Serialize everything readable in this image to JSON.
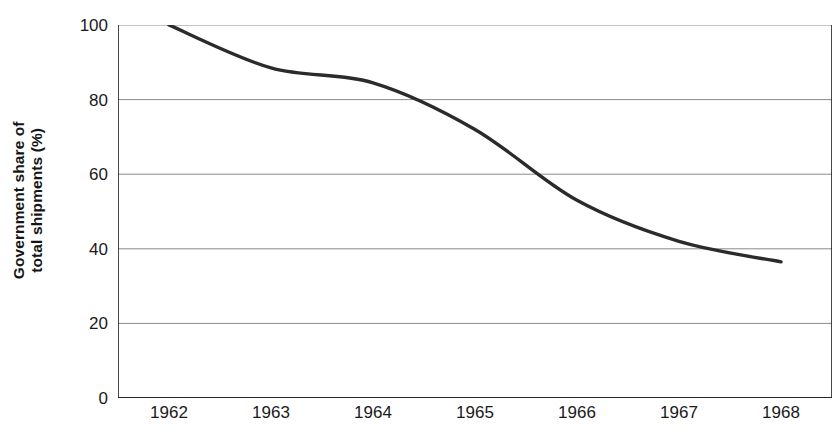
{
  "chart_data": {
    "type": "line",
    "title": "",
    "xlabel": "",
    "ylabel": "Government share of total shipments (%)",
    "ylabel_lines": [
      "Government share of",
      "total shipments (%)"
    ],
    "categories": [
      "1962",
      "1963",
      "1964",
      "1965",
      "1966",
      "1967",
      "1968"
    ],
    "series": [
      {
        "name": "Government share of total shipments",
        "values": [
          100,
          88.5,
          84.5,
          72,
          53,
          42,
          36.5
        ],
        "color": "#2b2b2b"
      }
    ],
    "ylim": [
      0,
      100
    ],
    "y_ticks": [
      0,
      20,
      40,
      60,
      80,
      100
    ],
    "y_tick_labels": [
      "0",
      "20",
      "40",
      "60",
      "80",
      "100"
    ],
    "grid": true,
    "grid_axis": "y",
    "grid_color": "#8a8a8a",
    "axis_color": "#1a1a1a",
    "legend": "none",
    "smoothing": true,
    "tick_placement": "between-categories"
  },
  "colors": {
    "background": "#ffffff",
    "line": "#2b2b2b",
    "gridline": "#8a8a8a",
    "axis": "#1a1a1a",
    "text": "#1a1a1a"
  }
}
